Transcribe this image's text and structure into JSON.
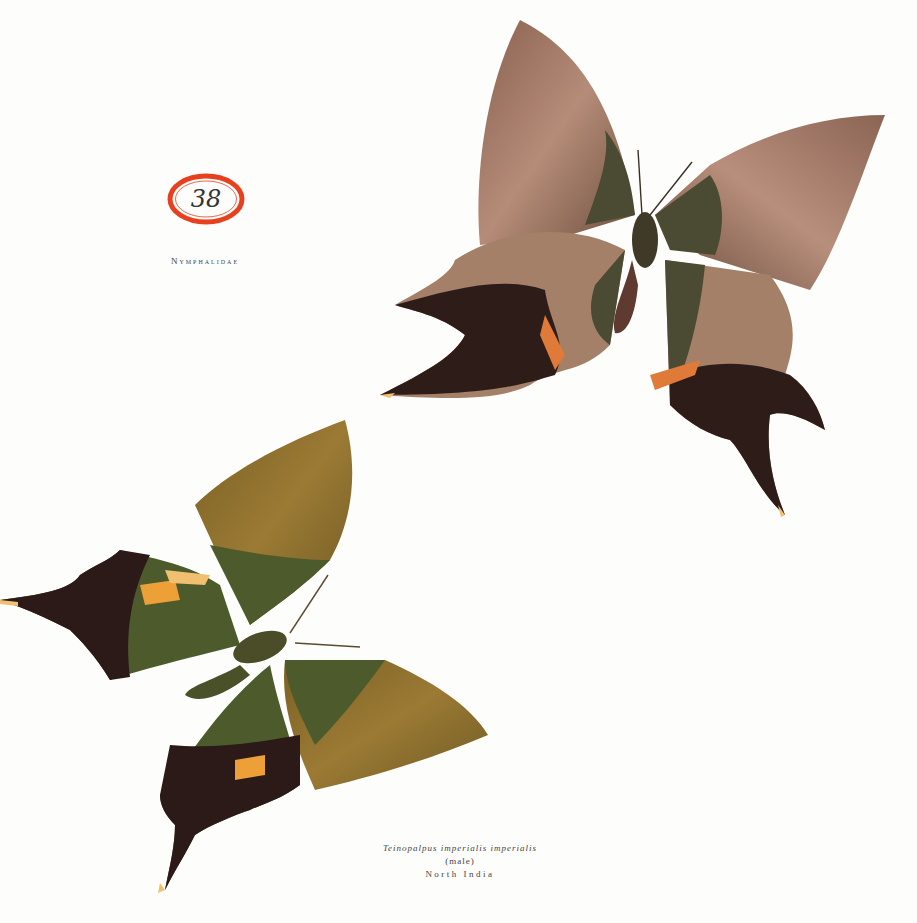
{
  "plate": {
    "number": "38",
    "family": "Nymphalidae",
    "badge_color": "#e8401e"
  },
  "caption": {
    "species": "Teinopalpus imperialis imperialis",
    "sex": "(male)",
    "locality": "North India"
  },
  "illustrations": [
    {
      "name": "upper-specimen",
      "view": "upperside",
      "colors": {
        "wing": "#9c7560",
        "inner": "#4b4a33",
        "tail": "#2a1a16",
        "accent": "#e07a38"
      }
    },
    {
      "name": "lower-specimen",
      "view": "upperside",
      "colors": {
        "wing": "#8f6e2c",
        "inner": "#4d5a2c",
        "tail": "#2b1a18",
        "accent": "#eea038"
      }
    }
  ]
}
